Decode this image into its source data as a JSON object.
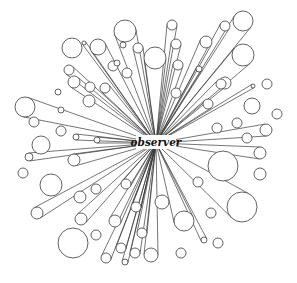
{
  "diagram": {
    "center_label": "observer",
    "center": {
      "x": 156,
      "y": 143
    },
    "label_box": {
      "x": 136,
      "y": 135,
      "w": 40,
      "h": 14
    },
    "colors": {
      "stroke": "#3a3a3a",
      "background": "#ffffff",
      "text": "#111111"
    },
    "objects": [
      {
        "x": 125,
        "y": 31,
        "r": 11,
        "ray": true
      },
      {
        "x": 172,
        "y": 25,
        "r": 5,
        "ray": true
      },
      {
        "x": 155,
        "y": 58,
        "r": 11,
        "ray": true
      },
      {
        "x": 138,
        "y": 48,
        "r": 5,
        "ray": true
      },
      {
        "x": 176,
        "y": 44,
        "r": 5,
        "ray": true
      },
      {
        "x": 178,
        "y": 65,
        "r": 5,
        "ray": true
      },
      {
        "x": 243,
        "y": 21,
        "r": 10,
        "ray": true
      },
      {
        "x": 225,
        "y": 26,
        "r": 5,
        "ray": true
      },
      {
        "x": 206,
        "y": 42,
        "r": 6,
        "ray": true
      },
      {
        "x": 243,
        "y": 55,
        "r": 11,
        "ray": true
      },
      {
        "x": 225,
        "y": 83,
        "r": 6,
        "ray": false
      },
      {
        "x": 267,
        "y": 84,
        "r": 5,
        "ray": false
      },
      {
        "x": 253,
        "y": 86,
        "r": 2,
        "ray": true
      },
      {
        "x": 252,
        "y": 106,
        "r": 8,
        "ray": false
      },
      {
        "x": 277,
        "y": 114,
        "r": 5,
        "ray": false
      },
      {
        "x": 237,
        "y": 123,
        "r": 5,
        "ray": false
      },
      {
        "x": 217,
        "y": 128,
        "r": 5,
        "ray": false
      },
      {
        "x": 266,
        "y": 130,
        "r": 6,
        "ray": true
      },
      {
        "x": 247,
        "y": 138,
        "r": 5,
        "ray": false
      },
      {
        "x": 260,
        "y": 153,
        "r": 6,
        "ray": true
      },
      {
        "x": 208,
        "y": 104,
        "r": 5,
        "ray": true
      },
      {
        "x": 221,
        "y": 84,
        "r": 5,
        "ray": true
      },
      {
        "x": 223,
        "y": 166,
        "r": 15,
        "ray": false
      },
      {
        "x": 260,
        "y": 174,
        "r": 6,
        "ray": false
      },
      {
        "x": 198,
        "y": 182,
        "r": 5,
        "ray": false
      },
      {
        "x": 242,
        "y": 207,
        "r": 15,
        "ray": true
      },
      {
        "x": 211,
        "y": 213,
        "r": 5,
        "ray": false
      },
      {
        "x": 162,
        "y": 202,
        "r": 7,
        "ray": false
      },
      {
        "x": 184,
        "y": 221,
        "r": 10,
        "ray": true
      },
      {
        "x": 204,
        "y": 240,
        "r": 3,
        "ray": true
      },
      {
        "x": 218,
        "y": 243,
        "r": 5,
        "ray": false
      },
      {
        "x": 151,
        "y": 255,
        "r": 7,
        "ray": true
      },
      {
        "x": 181,
        "y": 253,
        "r": 5,
        "ray": false
      },
      {
        "x": 80,
        "y": 197,
        "r": 6,
        "ray": false
      },
      {
        "x": 96,
        "y": 189,
        "r": 5,
        "ray": false
      },
      {
        "x": 126,
        "y": 184,
        "r": 5,
        "ray": true
      },
      {
        "x": 81,
        "y": 219,
        "r": 6,
        "ray": true
      },
      {
        "x": 115,
        "y": 221,
        "r": 6,
        "ray": true
      },
      {
        "x": 73,
        "y": 243,
        "r": 15,
        "ray": false
      },
      {
        "x": 96,
        "y": 235,
        "r": 5,
        "ray": false
      },
      {
        "x": 136,
        "y": 207,
        "r": 5,
        "ray": true
      },
      {
        "x": 142,
        "y": 233,
        "r": 5,
        "ray": true
      },
      {
        "x": 121,
        "y": 248,
        "r": 5,
        "ray": true
      },
      {
        "x": 135,
        "y": 253,
        "r": 5,
        "ray": true
      },
      {
        "x": 106,
        "y": 258,
        "r": 5,
        "ray": true
      },
      {
        "x": 125,
        "y": 262,
        "r": 3,
        "ray": true
      },
      {
        "x": 41,
        "y": 145,
        "r": 9,
        "ray": false
      },
      {
        "x": 29,
        "y": 157,
        "r": 4,
        "ray": true
      },
      {
        "x": 74,
        "y": 160,
        "r": 6,
        "ray": true
      },
      {
        "x": 23,
        "y": 173,
        "r": 5,
        "ray": false
      },
      {
        "x": 51,
        "y": 185,
        "r": 11,
        "ray": false
      },
      {
        "x": 37,
        "y": 213,
        "r": 6,
        "ray": true
      },
      {
        "x": 25,
        "y": 107,
        "r": 10,
        "ray": true
      },
      {
        "x": 34,
        "y": 122,
        "r": 5,
        "ray": false
      },
      {
        "x": 58,
        "y": 92,
        "r": 3,
        "ray": false
      },
      {
        "x": 61,
        "y": 110,
        "r": 3,
        "ray": false
      },
      {
        "x": 61,
        "y": 131,
        "r": 5,
        "ray": false
      },
      {
        "x": 89,
        "y": 101,
        "r": 6,
        "ray": false
      },
      {
        "x": 76,
        "y": 137,
        "r": 3,
        "ray": true
      },
      {
        "x": 97,
        "y": 140,
        "r": 3,
        "ray": true
      },
      {
        "x": 74,
        "y": 82,
        "r": 6,
        "ray": true
      },
      {
        "x": 90,
        "y": 87,
        "r": 5,
        "ray": false
      },
      {
        "x": 72,
        "y": 48,
        "r": 10,
        "ray": false
      },
      {
        "x": 84,
        "y": 43,
        "r": 2,
        "ray": true
      },
      {
        "x": 98,
        "y": 47,
        "r": 8,
        "ray": true
      },
      {
        "x": 69,
        "y": 70,
        "r": 5,
        "ray": true
      },
      {
        "x": 113,
        "y": 66,
        "r": 5,
        "ray": false
      },
      {
        "x": 105,
        "y": 88,
        "r": 5,
        "ray": true
      },
      {
        "x": 117,
        "y": 63,
        "r": 3,
        "ray": false
      },
      {
        "x": 127,
        "y": 73,
        "r": 5,
        "ray": false
      },
      {
        "x": 176,
        "y": 93,
        "r": 5,
        "ray": false
      },
      {
        "x": 199,
        "y": 69,
        "r": 3,
        "ray": true
      },
      {
        "x": 123,
        "y": 45,
        "r": 3,
        "ray": false
      }
    ]
  }
}
